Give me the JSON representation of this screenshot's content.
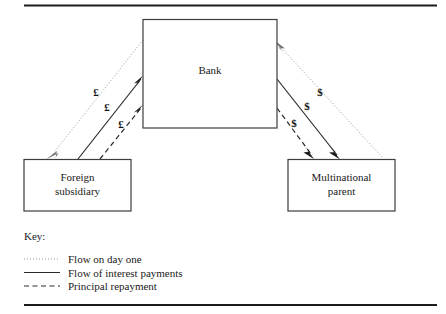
{
  "figure": {
    "nodes": [
      {
        "id": "bank",
        "label": "Bank"
      },
      {
        "id": "foreign-subsidiary",
        "label_line1": "Foreign",
        "label_line2": "subsidiary"
      },
      {
        "id": "multinational-parent",
        "label_line1": "Multinational",
        "label_line2": "parent"
      }
    ],
    "currency_labels": {
      "left_day_one": "£",
      "left_interest": "£",
      "left_principal": "£",
      "right_day_one": "$",
      "right_interest": "$",
      "right_principal": "$"
    },
    "key": {
      "heading": "Key:",
      "items": [
        {
          "style": "dotted",
          "label": "Flow on day one"
        },
        {
          "style": "solid",
          "label": "Flow of interest payments"
        },
        {
          "style": "dashed",
          "label": "Principal repayment"
        }
      ]
    },
    "colors": {
      "rule": "#1c1c1c",
      "box_border": "#3d3d3d",
      "dotted_flow": "#9a9a9a",
      "solid_flow": "#2b2b2b",
      "dashed_flow": "#2b2b2b",
      "text": "#1a1a1a",
      "background": "#ffffff"
    }
  }
}
